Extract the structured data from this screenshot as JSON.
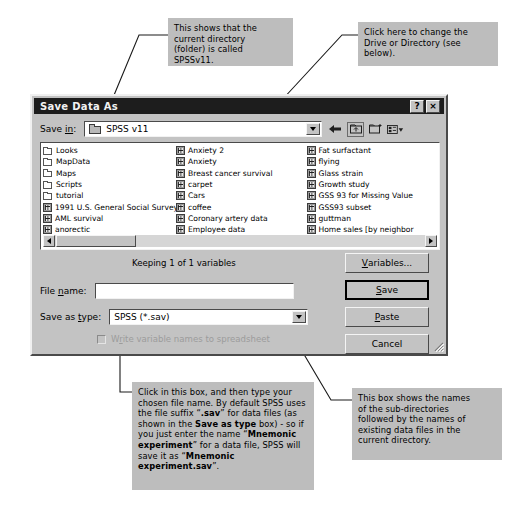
{
  "dialog": {
    "title": "Save Data As",
    "title_buttons": [
      {
        "name": "help-button",
        "glyph": "?"
      },
      {
        "name": "close-button",
        "glyph": "×"
      }
    ],
    "save_in": {
      "label": "Save in:",
      "label_prefix": "Save ",
      "label_accel": "in",
      "label_suffix": ":",
      "value": "SPSS v11",
      "icon": "folder-icon"
    },
    "toolbar": [
      {
        "name": "back-icon",
        "tooltip": "Back"
      },
      {
        "name": "up-one-level-icon",
        "tooltip": "Up One Level"
      },
      {
        "name": "new-folder-icon",
        "tooltip": "Create New Folder"
      },
      {
        "name": "views-icon",
        "tooltip": "Views"
      }
    ],
    "file_list": {
      "columns": [
        [
          {
            "name": "Looks",
            "type": "folder"
          },
          {
            "name": "MapData",
            "type": "folder"
          },
          {
            "name": "Maps",
            "type": "folder"
          },
          {
            "name": "Scripts",
            "type": "folder"
          },
          {
            "name": "tutorial",
            "type": "folder"
          },
          {
            "name": "1991 U.S. General Social Survey",
            "type": "data"
          },
          {
            "name": "AML survival",
            "type": "data"
          },
          {
            "name": "anorectic",
            "type": "data"
          }
        ],
        [
          {
            "name": "Anxiety 2",
            "type": "data"
          },
          {
            "name": "Anxiety",
            "type": "data"
          },
          {
            "name": "Breast cancer survival",
            "type": "data"
          },
          {
            "name": "carpet",
            "type": "data"
          },
          {
            "name": "Cars",
            "type": "data"
          },
          {
            "name": "coffee",
            "type": "data"
          },
          {
            "name": "Coronary artery data",
            "type": "data"
          },
          {
            "name": "Employee data",
            "type": "data"
          }
        ],
        [
          {
            "name": "Fat surfactant",
            "type": "data"
          },
          {
            "name": "flying",
            "type": "data"
          },
          {
            "name": "Glass strain",
            "type": "data"
          },
          {
            "name": "Growth study",
            "type": "data"
          },
          {
            "name": "GSS 93 for Missing Value",
            "type": "data"
          },
          {
            "name": "GSS93 subset",
            "type": "data"
          },
          {
            "name": "guttman",
            "type": "data"
          },
          {
            "name": "Home sales [by neighbor",
            "type": "data"
          }
        ]
      ]
    },
    "keeping_text": "Keeping 1 of 1 variables",
    "file_name": {
      "label_prefix": "File ",
      "label_accel": "n",
      "label_suffix": "ame:",
      "value": "",
      "placeholder": ""
    },
    "save_as_type": {
      "label_prefix": "Save as ",
      "label_accel": "t",
      "label_suffix": "ype:",
      "value": "SPSS (*.sav)",
      "options": [
        "SPSS (*.sav)"
      ]
    },
    "write_var_names": {
      "label_prefix": "W",
      "label_accel": "r",
      "label_suffix": "ite variable names to spreadsheet",
      "checked": false,
      "disabled": true
    },
    "buttons": [
      {
        "name": "variables-button",
        "prefix": "",
        "accel": "V",
        "suffix": "ariables...",
        "default": false
      },
      {
        "name": "save-button",
        "prefix": "",
        "accel": "S",
        "suffix": "ave",
        "default": true
      },
      {
        "name": "paste-button",
        "prefix": "",
        "accel": "P",
        "suffix": "aste",
        "default": false
      },
      {
        "name": "cancel-button",
        "prefix": "Cancel",
        "accel": "",
        "suffix": "",
        "default": false
      }
    ]
  },
  "annotations": {
    "current_directory": {
      "lines": [
        "This shows that the",
        "current directory",
        "(folder) is called",
        "SPSSv11."
      ]
    },
    "change_drive": {
      "lines": [
        "Click here to change the",
        "Drive or Directory (see",
        "below)."
      ]
    },
    "file_name_box": {
      "text_runs": [
        {
          "t": "Click in this box, and then type your chosen file name. By default SPSS uses the file suffix “",
          "b": false
        },
        {
          "t": ".sav",
          "b": true
        },
        {
          "t": "” for data files (as shown in the ",
          "b": false
        },
        {
          "t": "Save as type",
          "b": true
        },
        {
          "t": " box) - so if you just enter the name “",
          "b": false
        },
        {
          "t": "Mnemonic experiment",
          "b": true
        },
        {
          "t": "” for a data file, SPSS will save it as “",
          "b": false
        },
        {
          "t": "Mnemonic experiment.sav",
          "b": true
        },
        {
          "t": "”.",
          "b": false
        }
      ]
    },
    "file_list_box": {
      "lines": [
        "This box shows the names",
        "of the sub-directories",
        "followed by the names of",
        "existing data files in the",
        "current directory."
      ]
    }
  },
  "colors": {
    "callout_bg": "#bdbdbd",
    "dialog_face": "#c3c3c3",
    "titlebar": "#1d1d1d",
    "field_bg": "#ffffff",
    "disabled_text": "#9c9c9c"
  }
}
